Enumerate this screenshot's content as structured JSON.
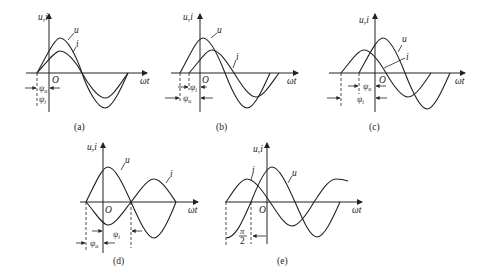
{
  "figure": {
    "axis_labels": {
      "y": "u,i",
      "x": "ωt",
      "origin": "O"
    },
    "panels": [
      {
        "id": "a",
        "caption": "(a)",
        "curve_labels": [
          "u",
          "i"
        ],
        "angle_labels": [
          "ψu",
          "ψi"
        ],
        "relation": "in phase (ψu = ψi)"
      },
      {
        "id": "b",
        "caption": "(b)",
        "curve_labels": [
          "u",
          "i"
        ],
        "angle_labels": [
          "ψi",
          "ψu"
        ],
        "relation": "u leads i"
      },
      {
        "id": "c",
        "caption": "(c)",
        "curve_labels": [
          "u",
          "i"
        ],
        "angle_labels": [
          "ψu",
          "ψi"
        ],
        "relation": "i leads u"
      },
      {
        "id": "d",
        "caption": "(d)",
        "curve_labels": [
          "u",
          "i"
        ],
        "angle_labels": [
          "ψu",
          "ψi"
        ],
        "relation": "opposite phase"
      },
      {
        "id": "e",
        "caption": "(e)",
        "curve_labels": [
          "i",
          "u"
        ],
        "angle_labels": [
          "π/2"
        ],
        "relation": "quadrature (i leads u by π/2)"
      }
    ]
  },
  "labels": {
    "yaxis": "u,i",
    "xaxis": "ωt",
    "origin": "O",
    "u": "u",
    "i": "i",
    "psi_u": "ψ",
    "psi_i": "ψ",
    "sub_u": "u",
    "sub_i": "i",
    "pi": "π",
    "two": "2",
    "cap_a": "(a)",
    "cap_b": "(b)",
    "cap_c": "(c)",
    "cap_d": "(d)",
    "cap_e": "(e)"
  }
}
